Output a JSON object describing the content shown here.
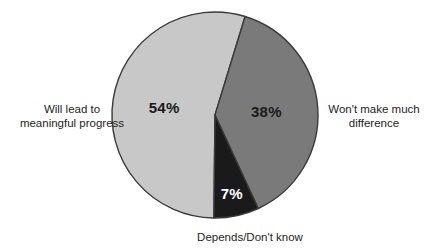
{
  "chart_data": {
    "type": "pie",
    "title": "",
    "subtitle": "",
    "xlabel": "",
    "ylabel": "",
    "legend_position": "callout-labels",
    "grid": false,
    "categories": [
      "Will lead to meaningful progress",
      "Won't make much difference",
      "Depends/Don't know"
    ],
    "values": [
      54,
      38,
      7
    ],
    "value_labels": [
      "54%",
      "38%",
      "7%"
    ],
    "colors": [
      "#c8c8c8",
      "#7a7a7a",
      "#1a1a1a"
    ],
    "slices": [
      {
        "name": "Will lead to meaningful progress",
        "value": 54,
        "value_label": "54%",
        "color": "#c8c8c8",
        "label_color": "#1a1a1a",
        "label_line_1": "Will lead to",
        "label_line_2": "meaningful progress"
      },
      {
        "name": "Won't make much difference",
        "value": 38,
        "value_label": "38%",
        "color": "#7a7a7a",
        "label_color": "#1a1a1a",
        "label_line_1": "Won't make much",
        "label_line_2": "difference"
      },
      {
        "name": "Depends/Don't know",
        "value": 7,
        "value_label": "7%",
        "color": "#1a1a1a",
        "label_color": "#ffffff",
        "label_line_1": "Depends/Don't know",
        "label_line_2": ""
      }
    ]
  },
  "chart": {
    "outline_color": "#3a3a3a",
    "background": "#ffffff",
    "center_x": 215,
    "center_y": 115,
    "radius": 103,
    "start_angle_deg": 17
  },
  "labels": {
    "left_line_1": "Will lead to",
    "left_line_2": "meaningful progress",
    "right_line_1": "Won't make much",
    "right_line_2": "difference",
    "bottom_line_1": "Depends/Don't know",
    "pct_left": "54%",
    "pct_right": "38%",
    "pct_bottom": "7%"
  }
}
